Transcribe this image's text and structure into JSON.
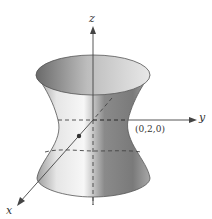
{
  "figure": {
    "axes": {
      "x_label": "x",
      "y_label": "y",
      "z_label": "z"
    },
    "point_label": "(0,2,0)",
    "colors": {
      "axis": "#444444",
      "surface_dark": "#6e6e6e",
      "surface_light": "#f2f2f2",
      "background": "#ffffff"
    }
  }
}
